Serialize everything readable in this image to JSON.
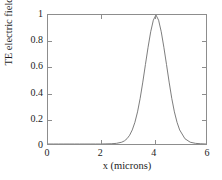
{
  "chart_data": {
    "type": "line",
    "title": "",
    "xlabel": "x (microns)",
    "ylabel": "TE electric field",
    "xlim": [
      0,
      6
    ],
    "ylim": [
      0,
      1
    ],
    "xticks": [
      "0",
      "2",
      "4",
      "6"
    ],
    "xtick_values": [
      0,
      2,
      4,
      6
    ],
    "yticks": [
      "0",
      "0.2",
      "0.4",
      "0.6",
      "0.8",
      "1"
    ],
    "ytick_values": [
      0,
      0.2,
      0.4,
      0.6,
      0.8,
      1
    ],
    "grid": false,
    "legend": null,
    "line_color": "#6e6e6e",
    "axis_color": "#8d8d8d",
    "background": "#ffffff",
    "series": [
      {
        "name": "TE electric field",
        "description": "Gaussian mode profile peaked at x = 4 microns, amplitude 1, FWHM about 0.62 microns",
        "x": [
          0.0,
          0.2,
          0.4,
          0.6,
          0.8,
          1.0,
          1.2,
          1.4,
          1.6,
          1.8,
          2.0,
          2.2,
          2.4,
          2.6,
          2.8,
          2.9,
          3.0,
          3.1,
          3.2,
          3.3,
          3.4,
          3.5,
          3.6,
          3.7,
          3.8,
          3.9,
          4.0,
          4.1,
          4.2,
          4.3,
          4.4,
          4.5,
          4.6,
          4.7,
          4.8,
          4.9,
          5.0,
          5.2,
          5.4,
          5.6,
          5.8,
          6.0
        ],
        "y": [
          0.0,
          0.0,
          0.0,
          0.0,
          0.0,
          0.0,
          0.0,
          0.0,
          0.0,
          0.0,
          0.0,
          0.001,
          0.002,
          0.005,
          0.014,
          0.024,
          0.041,
          0.068,
          0.109,
          0.168,
          0.249,
          0.354,
          0.48,
          0.616,
          0.75,
          0.87,
          0.96,
          1.0,
          0.96,
          0.87,
          0.75,
          0.616,
          0.48,
          0.354,
          0.249,
          0.168,
          0.109,
          0.041,
          0.014,
          0.005,
          0.002,
          0.0
        ]
      }
    ]
  },
  "axes": {
    "y_label": "TE electric field",
    "x_label": "x (microns)"
  }
}
